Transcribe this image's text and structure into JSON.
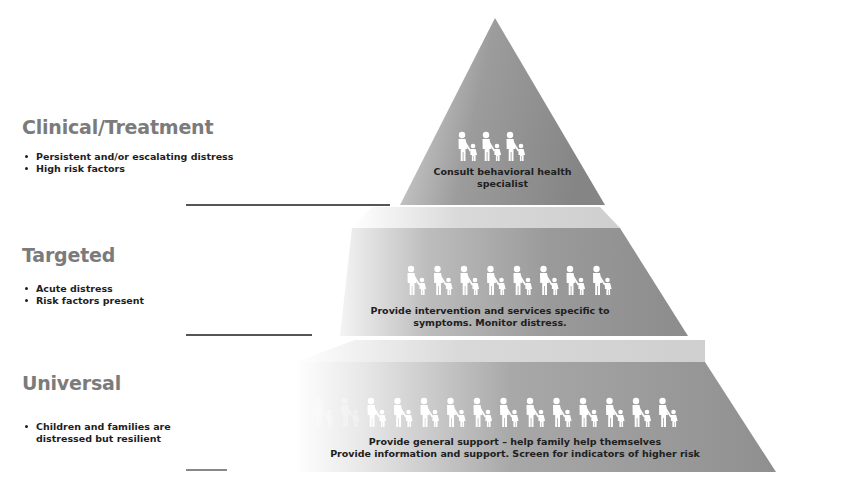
{
  "tiers": [
    {
      "id": "clinical",
      "heading": "Clinical/Treatment",
      "bullets": [
        "Persistent and/or escalating distress",
        "High risk factors"
      ],
      "pyramid_text": [
        "Consult behavioral health",
        "specialist"
      ],
      "family_groups": 3
    },
    {
      "id": "targeted",
      "heading": "Targeted",
      "bullets": [
        "Acute distress",
        "Risk factors present"
      ],
      "pyramid_text": [
        "Provide intervention and services specific to",
        "symptoms. Monitor distress."
      ],
      "family_groups": 8
    },
    {
      "id": "universal",
      "heading": "Universal",
      "bullets": [
        "Children and families are",
        "distressed but resilient"
      ],
      "pyramid_text": [
        "Provide general support – help family help themselves",
        "Provide information and support. Screen for indicators of higher risk"
      ],
      "family_groups": 14
    }
  ],
  "colors": {
    "heading": "#7b7b7b",
    "body_text": "#1e1e1e",
    "pyramid_dark": "#8a8a8a",
    "pyramid_light": "#e8e8e8",
    "figure": "#ffffff",
    "divider": "#555555"
  }
}
